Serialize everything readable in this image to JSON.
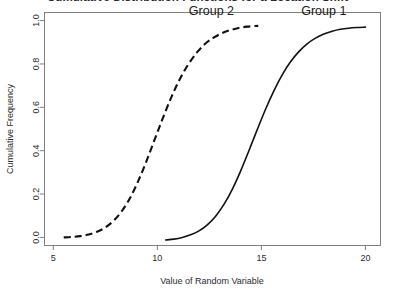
{
  "chart_data": {
    "type": "line",
    "title": "Cumulative Distribution Functions for a Location Shift",
    "title_visible_fragment": "tions for a Location Shift",
    "xlabel": "Value of Random Variable",
    "ylabel": "Cumulative Frequency",
    "xlim": [
      4.6,
      20.7
    ],
    "ylim": [
      -0.035,
      1.035
    ],
    "xticks": [
      5,
      10,
      15,
      20
    ],
    "xtick_labels": [
      "5",
      "10",
      "15",
      "20"
    ],
    "yticks": [
      0.0,
      0.2,
      0.4,
      0.6,
      0.8,
      1.0
    ],
    "ytick_labels": [
      "0.0",
      "0.2",
      "0.4",
      "0.6",
      "0.8",
      "1.0"
    ],
    "grid": false,
    "legend_position": "inline-annotations",
    "line_color": "#111111",
    "background_color": "#ffffff",
    "axis_color": "#808080",
    "series": [
      {
        "name": "Group 1",
        "label": "Group 1",
        "linestyle": "solid",
        "label_x": 18.0,
        "label_y": 1.045,
        "median": 14.8,
        "x": [
          10.4,
          10.8,
          11.2,
          11.6,
          12.0,
          12.4,
          12.8,
          13.2,
          13.6,
          14.0,
          14.4,
          14.8,
          15.2,
          15.6,
          16.0,
          16.4,
          16.8,
          17.2,
          17.6,
          18.0,
          18.4,
          18.8,
          19.2,
          19.6,
          20.0
        ],
        "y": [
          -0.012,
          -0.008,
          0.0,
          0.012,
          0.03,
          0.058,
          0.098,
          0.152,
          0.222,
          0.306,
          0.4,
          0.497,
          0.591,
          0.676,
          0.75,
          0.81,
          0.857,
          0.893,
          0.919,
          0.938,
          0.951,
          0.96,
          0.965,
          0.968,
          0.97
        ]
      },
      {
        "name": "Group 2",
        "label": "Group 2",
        "linestyle": "dashed",
        "label_x": 12.6,
        "label_y": 1.045,
        "median": 10.05,
        "x": [
          5.5,
          5.9,
          6.3,
          6.7,
          7.1,
          7.5,
          7.9,
          8.3,
          8.7,
          9.1,
          9.5,
          9.9,
          10.3,
          10.7,
          11.1,
          11.5,
          11.9,
          12.3,
          12.7,
          13.1,
          13.5,
          13.9,
          14.3,
          14.7,
          14.85
        ],
        "y": [
          0.0,
          0.002,
          0.006,
          0.013,
          0.026,
          0.046,
          0.077,
          0.122,
          0.184,
          0.264,
          0.358,
          0.459,
          0.559,
          0.653,
          0.734,
          0.8,
          0.853,
          0.893,
          0.921,
          0.942,
          0.956,
          0.966,
          0.972,
          0.975,
          0.976
        ]
      }
    ]
  }
}
